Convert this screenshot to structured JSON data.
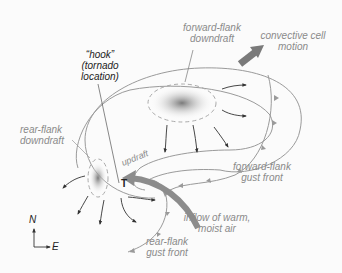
{
  "labels": {
    "forward_flank_downdraft": [
      "forward-flank",
      "downdraft"
    ],
    "convective_cell_motion": [
      "convective cell",
      "motion"
    ],
    "hook": [
      "“hook”",
      "(tornado",
      "location)"
    ],
    "rear_flank_downdraft": [
      "rear-flank",
      "downdraft"
    ],
    "updraft": "updraft",
    "tornado_marker": "T",
    "forward_flank_gust_front": [
      "forward-flank",
      "gust front"
    ],
    "inflow": [
      "inflow of warm,",
      "moist air"
    ],
    "rear_flank_gust_front": [
      "rear-flank",
      "gust front"
    ],
    "compass_north": "N",
    "compass_east": "E"
  },
  "colors": {
    "outline": "#9a9a9a",
    "arrow": "#333333",
    "inflow_arrow": "#8c8c8c",
    "label_gray": "#8a8a8a",
    "label_dark": "#222222",
    "shading": "#7a7a7a"
  }
}
